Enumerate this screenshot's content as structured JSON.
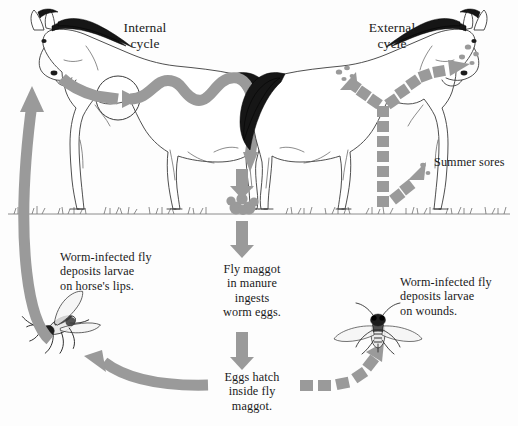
{
  "figure": {
    "background_color": "#fdfdfd",
    "arrow_color": "#9a9a9a",
    "ink_color": "#1a1a1a"
  },
  "headings": {
    "internal_cycle": "Internal\ncycle",
    "external_cycle": "External\ncycle"
  },
  "captions": {
    "left_fly": "Worm-infected fly\ndeposits larvae\non horse's lips.",
    "maggot": "Fly maggot\nin manure\ningests\nworm eggs.",
    "eggs": "Eggs  hatch\ninside fly\nmaggot.",
    "right_fly": "Worm-infected fly\ndeposits larvae\non wounds.",
    "summer_sores": "Summer sores"
  },
  "illustrations": {
    "horse_left": "horse-facing-left",
    "horse_right": "horse-facing-right",
    "fly_left": "housefly-side-view",
    "fly_right": "housefly-top-view",
    "manure": "manure-pile",
    "ground": "grass-ground-line"
  },
  "arrows": {
    "internal_body": "solid-wavy-arrow-through-horse-gut",
    "to_manure": "solid-down-arrow-to-manure",
    "manure_to_maggot": "solid-down-arrow",
    "maggot_to_eggs": "solid-down-arrow",
    "eggs_to_left_fly": "solid-curved-arrow-left",
    "left_fly_to_lips": "solid-curved-arrow-up",
    "eggs_to_right_fly": "dashed-curved-arrow-right",
    "right_fly_up_leg": "dashed-vertical-arrow",
    "up_to_shoulder": "dashed-branch-arrow",
    "up_to_head": "dashed-branch-arrow",
    "to_summer_sores": "dashed-branch-arrow-leg"
  }
}
